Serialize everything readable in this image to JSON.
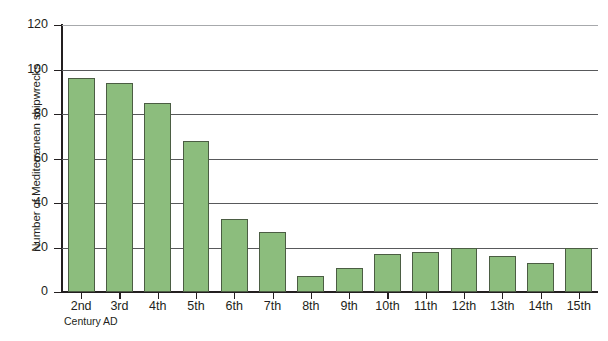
{
  "chart_data": {
    "type": "bar",
    "title": "",
    "xlabel": "Century AD",
    "ylabel": "Number of Mediterranean shipwrecks",
    "categories": [
      "2nd",
      "3rd",
      "4th",
      "5th",
      "6th",
      "7th",
      "8th",
      "9th",
      "10th",
      "11th",
      "12th",
      "13th",
      "14th",
      "15th"
    ],
    "values": [
      96,
      94,
      85,
      68,
      33,
      27,
      7,
      11,
      17,
      18,
      20,
      16,
      13,
      20
    ],
    "ylim": [
      0,
      120
    ],
    "yticks": [
      0,
      20,
      40,
      60,
      80,
      100,
      120
    ],
    "ytick_labels": [
      "0",
      "20",
      "40",
      "60",
      "80",
      "100",
      "120"
    ],
    "grid": "horizontal",
    "legend": "none",
    "bar_color": "#8cbd7d",
    "bar_border_color": "#4b5d43",
    "axis_color": "#231f20",
    "gridline_color": "#58595b"
  },
  "figure": {
    "caption": ""
  }
}
